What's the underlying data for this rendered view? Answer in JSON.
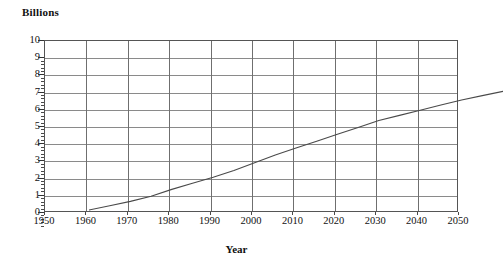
{
  "chart_data": {
    "type": "line",
    "title": "",
    "ylabel": "Billions",
    "xlabel": "Year",
    "xlim": [
      1950,
      2050
    ],
    "ylim": [
      0,
      10
    ],
    "grid": true,
    "legend": "none",
    "x_ticks": [
      1950,
      1960,
      1970,
      1980,
      1990,
      2000,
      2010,
      2020,
      2030,
      2040,
      2050
    ],
    "y_ticks": [
      0,
      1,
      2,
      3,
      4,
      5,
      6,
      7,
      8,
      9,
      10
    ],
    "series": [
      {
        "name": "World population",
        "x": [
          1950,
          1955,
          1960,
          1965,
          1970,
          1975,
          1980,
          1985,
          1990,
          1995,
          2000,
          2005,
          2010,
          2015,
          2020,
          2025,
          2030,
          2035,
          2040,
          2045,
          2050
        ],
        "values": [
          2.5,
          2.75,
          3.0,
          3.3,
          3.7,
          4.05,
          4.4,
          4.8,
          5.25,
          5.7,
          6.1,
          6.5,
          6.9,
          7.3,
          7.7,
          8.0,
          8.3,
          8.6,
          8.9,
          9.15,
          9.4
        ]
      }
    ]
  },
  "axes": {
    "y_title": "Billions",
    "x_title": "Year",
    "y_tick_labels": [
      "10",
      "9",
      "8",
      "7",
      "6",
      "5",
      "4",
      "3",
      "2",
      "1",
      "0"
    ],
    "x_tick_labels": [
      "1950",
      "1960",
      "1970",
      "1980",
      "1990",
      "2000",
      "2010",
      "2020",
      "2030",
      "2040",
      "2050"
    ]
  },
  "colors": {
    "background": "#ffffff",
    "grid": "#8a8a8a",
    "grid_vertical": "#6f6f6f",
    "axis": "#555555",
    "curve": "#4a4a4a",
    "text": "#111111"
  }
}
